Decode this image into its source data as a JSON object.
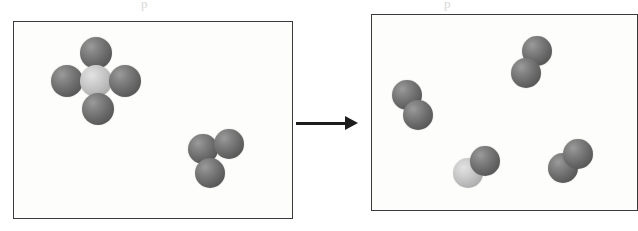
{
  "figure": {
    "width": 638,
    "height": 231,
    "background_color": "#ffffff",
    "border_color": "#3a3a3a",
    "sphere_dark_color": "#6e6e6e",
    "sphere_light_color": "#c4c4c4"
  },
  "ghost_text": {
    "top_left": "p",
    "top_right": "p",
    "bottom_center": "",
    "note": "faint bleed-through marks from the reverse of the scanned page"
  },
  "arrow": {
    "name": "reaction-arrow",
    "direction": "right",
    "label": "",
    "x": 296,
    "y": 116,
    "length": 62,
    "thickness": 3,
    "color": "#1d1d1d"
  },
  "panels": [
    {
      "id": "reactants",
      "label": "",
      "x": 13,
      "y": 21,
      "width": 280,
      "height": 198,
      "molecules": [
        {
          "name": "molecule-five-sphere-cluster",
          "atom_count": 5,
          "description": "central light sphere surrounded by four dark spheres",
          "atoms": [
            {
              "x": 95,
              "y": 52,
              "r": 16,
              "shade": "dark"
            },
            {
              "x": 66,
              "y": 80,
              "r": 16,
              "shade": "dark"
            },
            {
              "x": 95,
              "y": 80,
              "r": 16,
              "shade": "light"
            },
            {
              "x": 124,
              "y": 80,
              "r": 16,
              "shade": "dark"
            },
            {
              "x": 97,
              "y": 108,
              "r": 16,
              "shade": "dark"
            }
          ]
        },
        {
          "name": "molecule-three-sphere-cluster",
          "atom_count": 3,
          "description": "triangular cluster of three dark spheres",
          "atoms": [
            {
              "x": 202,
              "y": 148,
              "r": 15,
              "shade": "dark"
            },
            {
              "x": 228,
              "y": 143,
              "r": 15,
              "shade": "dark"
            },
            {
              "x": 209,
              "y": 172,
              "r": 15,
              "shade": "dark"
            }
          ]
        }
      ]
    },
    {
      "id": "products",
      "label": "",
      "x": 371,
      "y": 14,
      "width": 267,
      "height": 197,
      "molecules": [
        {
          "name": "molecule-pair-top-right",
          "atom_count": 2,
          "description": "diagonal pair of dark spheres, upper right region",
          "atoms": [
            {
              "x": 536,
              "y": 50,
              "r": 15,
              "shade": "dark"
            },
            {
              "x": 525,
              "y": 72,
              "r": 15,
              "shade": "dark"
            }
          ]
        },
        {
          "name": "molecule-pair-left",
          "atom_count": 2,
          "description": "diagonal pair of dark spheres, left region",
          "atoms": [
            {
              "x": 406,
              "y": 94,
              "r": 15,
              "shade": "dark"
            },
            {
              "x": 417,
              "y": 114,
              "r": 15,
              "shade": "dark"
            }
          ]
        },
        {
          "name": "molecule-pair-bottom-center",
          "atom_count": 2,
          "description": "pair with one light sphere and one dark sphere",
          "atoms": [
            {
              "x": 467,
              "y": 172,
              "r": 15,
              "shade": "light"
            },
            {
              "x": 484,
              "y": 160,
              "r": 15,
              "shade": "dark"
            }
          ]
        },
        {
          "name": "molecule-pair-bottom-right",
          "atom_count": 2,
          "description": "diagonal pair of dark spheres, lower right region",
          "atoms": [
            {
              "x": 562,
              "y": 167,
              "r": 15,
              "shade": "dark"
            },
            {
              "x": 577,
              "y": 153,
              "r": 15,
              "shade": "dark"
            }
          ]
        }
      ]
    }
  ]
}
